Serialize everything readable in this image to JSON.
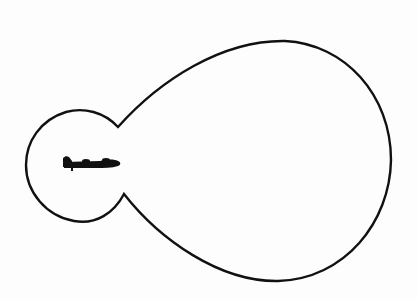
{
  "diagram": {
    "type": "radiation-pattern",
    "description": "Polar lobe pattern around an aircraft: small rear lobe and large forward lobe",
    "colors": {
      "background": "#fdfdfd",
      "outline": "#111111",
      "aircraft": "#111111"
    },
    "elements": {
      "aircraft_icon": "airplane-side-view-icon",
      "rear_lobe": "small-rear-lobe",
      "forward_lobe": "large-forward-lobe"
    }
  }
}
